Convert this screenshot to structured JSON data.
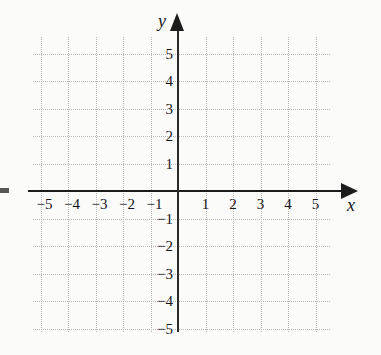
{
  "figure": {
    "kind": "coordinate-plane",
    "axis_names": {
      "x": "x",
      "y": "y"
    }
  },
  "chart_data": {
    "type": "scatter",
    "title": "",
    "subtitle": "",
    "xlabel": "x",
    "ylabel": "y",
    "grid": true,
    "grid_style": "dotted",
    "grid_color": "#b9b9b9",
    "axis_color": "#1c1c1c",
    "background_color": "#fbfbfa",
    "legend": null,
    "legend_position": "none",
    "xlim": [
      -5.4,
      5.4
    ],
    "ylim": [
      -5.4,
      5.4
    ],
    "x_major_step": 1,
    "y_major_step": 1,
    "xticks": [
      -5,
      -4,
      -3,
      -2,
      -1,
      1,
      2,
      3,
      4,
      5
    ],
    "yticks": [
      5,
      4,
      3,
      2,
      1,
      -1,
      -2,
      -3,
      -4,
      -5
    ],
    "xticklabels": [
      "−5",
      "−4",
      "−3",
      "−2",
      "−1",
      "1",
      "2",
      "3",
      "4",
      "5"
    ],
    "yticklabels": [
      "5",
      "4",
      "3",
      "2",
      "1",
      "−1",
      "−2",
      "−3",
      "−4",
      "−5"
    ],
    "origin_label": "",
    "series": [],
    "values": [],
    "annotations": [],
    "x_axis_arrow": true,
    "y_axis_arrow": true
  },
  "ticks": {
    "x": [
      {
        "value": -5,
        "label": "−5"
      },
      {
        "value": -4,
        "label": "−4"
      },
      {
        "value": -3,
        "label": "−3"
      },
      {
        "value": -2,
        "label": "−2"
      },
      {
        "value": -1,
        "label": "−1"
      },
      {
        "value": 1,
        "label": "1"
      },
      {
        "value": 2,
        "label": "2"
      },
      {
        "value": 3,
        "label": "3"
      },
      {
        "value": 4,
        "label": "4"
      },
      {
        "value": 5,
        "label": "5"
      }
    ],
    "y": [
      {
        "value": 5,
        "label": "5"
      },
      {
        "value": 4,
        "label": "4"
      },
      {
        "value": 3,
        "label": "3"
      },
      {
        "value": 2,
        "label": "2"
      },
      {
        "value": 1,
        "label": "1"
      },
      {
        "value": -1,
        "label": "−1"
      },
      {
        "value": -2,
        "label": "−2"
      },
      {
        "value": -3,
        "label": "−3"
      },
      {
        "value": -4,
        "label": "−4"
      },
      {
        "value": -5,
        "label": "−5"
      }
    ]
  }
}
